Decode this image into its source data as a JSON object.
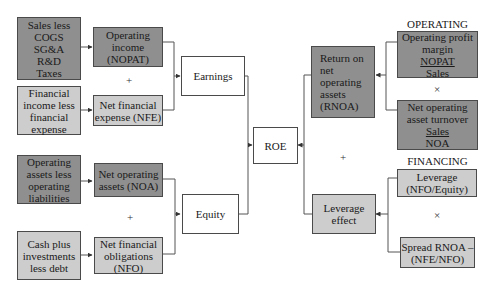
{
  "diagram": {
    "left": {
      "earnings_inputs": {
        "operating_source": [
          "Sales less",
          "COGS",
          "SG&A",
          "R&D",
          "Taxes"
        ],
        "operating_income": [
          "Operating",
          "income",
          "(NOPAT)"
        ],
        "plus": "+",
        "financial_source": [
          "Financial",
          "income less",
          "financial",
          "expense"
        ],
        "net_financial_expense": [
          "Net financial",
          "expense (NFE)"
        ]
      },
      "earnings": "Earnings",
      "equity_inputs": {
        "operating_source": [
          "Operating",
          "assets less",
          "operating",
          "liabilities"
        ],
        "net_operating_assets": [
          "Net operating",
          "assets (NOA)"
        ],
        "plus": "+",
        "financial_source": [
          "Cash plus",
          "investments",
          "less debt"
        ],
        "net_financial_obligations": [
          "Net financial",
          "obligations",
          "(NFO)"
        ]
      },
      "equity": "Equity"
    },
    "center": {
      "roe": "ROE"
    },
    "right": {
      "rnoa": [
        "Return on",
        "net",
        "operating",
        "assets",
        "(RNOA)"
      ],
      "plus": "+",
      "leverage_effect": [
        "Leverage",
        "effect"
      ],
      "operating": {
        "heading": "OPERATING",
        "profit_margin": {
          "title": [
            "Operating profit",
            "margin"
          ],
          "numerator": "NOPAT",
          "denominator": "Sales"
        },
        "times": "×",
        "asset_turnover": {
          "title": [
            "Net operating",
            "asset turnover"
          ],
          "numerator": "Sales",
          "denominator": "NOA"
        }
      },
      "financing": {
        "heading": "FINANCING",
        "leverage": [
          "Leverage",
          "(NFO/Equity)"
        ],
        "times": "×",
        "spread": [
          "Spread RNOA –",
          "(NFE/NFO)"
        ]
      }
    }
  },
  "colors": {
    "dark_box": "#8f8f8f",
    "light_box": "#cdcdcd",
    "white_box": "#ffffff",
    "border": "#4a4a4a",
    "line": "#555555"
  }
}
